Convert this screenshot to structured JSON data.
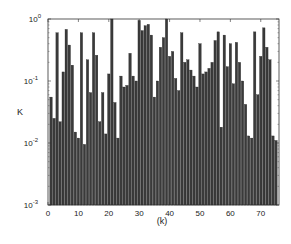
{
  "chart_data": {
    "type": "bar",
    "title": "",
    "xlabel": "(k)",
    "ylabel": "K",
    "yscale": "log",
    "ylim": [
      0.001,
      1
    ],
    "xlim": [
      0,
      76
    ],
    "grid": false,
    "legend": null,
    "bar_color": "#3a3a3a",
    "x_ticks": [
      0,
      10,
      20,
      30,
      40,
      50,
      60,
      70
    ],
    "y_ticks": [
      {
        "value": 0.001,
        "label": "10^-3"
      },
      {
        "value": 0.01,
        "label": "10^-2"
      },
      {
        "value": 0.1,
        "label": "10^-1"
      },
      {
        "value": 1,
        "label": "10^0"
      }
    ],
    "x": [
      1,
      2,
      3,
      4,
      5,
      6,
      7,
      8,
      9,
      10,
      11,
      12,
      13,
      14,
      15,
      16,
      17,
      18,
      19,
      20,
      21,
      22,
      23,
      24,
      25,
      26,
      27,
      28,
      29,
      30,
      31,
      32,
      33,
      34,
      35,
      36,
      37,
      38,
      39,
      40,
      41,
      42,
      43,
      44,
      45,
      46,
      47,
      48,
      49,
      50,
      51,
      52,
      53,
      54,
      55,
      56,
      57,
      58,
      59,
      60,
      61,
      62,
      63,
      64,
      65,
      66,
      67,
      68,
      69,
      70,
      71,
      72,
      73,
      74,
      75
    ],
    "values": [
      0.055,
      0.025,
      0.6,
      0.022,
      0.14,
      0.68,
      0.38,
      0.18,
      0.015,
      0.012,
      0.6,
      0.0095,
      0.22,
      0.065,
      0.6,
      0.26,
      0.022,
      0.065,
      0.014,
      0.13,
      1.0,
      0.045,
      0.012,
      0.12,
      0.08,
      0.085,
      0.28,
      0.12,
      0.1,
      0.95,
      0.65,
      0.78,
      0.82,
      0.55,
      0.055,
      0.1,
      0.35,
      0.5,
      1.0,
      0.25,
      0.3,
      0.11,
      0.07,
      0.6,
      0.2,
      0.22,
      0.15,
      0.12,
      0.08,
      0.4,
      0.13,
      0.14,
      0.16,
      0.2,
      0.45,
      0.62,
      0.018,
      0.55,
      0.17,
      0.4,
      0.09,
      0.42,
      0.2,
      0.1,
      0.042,
      0.013,
      0.012,
      0.62,
      0.06,
      0.25,
      0.72,
      0.35,
      0.22,
      0.013,
      0.011
    ]
  }
}
